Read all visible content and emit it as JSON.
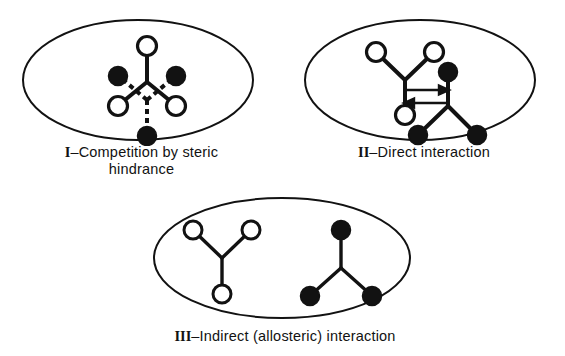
{
  "figure": {
    "background_color": "#ffffff",
    "ink_color": "#121212",
    "open_node_fill": "#ffffff",
    "filled_node_fill": "#121212",
    "width": 565,
    "height": 356
  },
  "panels": [
    {
      "id": "panel-1",
      "numeral": "I",
      "separator": "–",
      "caption_text": "Competition by steric\nhindrance",
      "caption_full": "I–Competition by steric hindrance",
      "description": "Two overlapping Y-shaped ligands sharing one binding site: a solid-line Y with open circles pointing up and a dashed-line Y with filled circles pointing down, crossing to form a diamond.",
      "shapes": {
        "ellipse": {
          "cx": 120,
          "cy": 62,
          "rx": 115,
          "ry": 60
        },
        "solid_y": {
          "style": "solid",
          "node_type": "open",
          "vertex": {
            "x": 129,
            "y": 64
          },
          "nodes": [
            {
              "x": 129,
              "y": 28,
              "label": "top-open-node"
            },
            {
              "x": 100,
              "y": 88,
              "label": "lower-left-open-node"
            },
            {
              "x": 158,
              "y": 88,
              "label": "lower-right-open-node"
            }
          ]
        },
        "dashed_y": {
          "style": "dashed",
          "node_type": "filled",
          "vertex": {
            "x": 129,
            "y": 82
          },
          "nodes": [
            {
              "x": 129,
              "y": 118,
              "label": "bottom-filled-node"
            },
            {
              "x": 100,
              "y": 58,
              "label": "upper-left-filled-node"
            },
            {
              "x": 158,
              "y": 58,
              "label": "upper-right-filled-node"
            }
          ]
        }
      }
    },
    {
      "id": "panel-2",
      "numeral": "II",
      "separator": "–",
      "caption_text": "Direct interaction",
      "caption_full": "II–Direct interaction",
      "description": "Two Y-shaped ligands at adjacent sites linked by a pair of opposed horizontal arrows indicating mutual direct influence.",
      "shapes": {
        "ellipse": {
          "cx": 120,
          "cy": 62,
          "rx": 115,
          "ry": 60
        },
        "open_y": {
          "style": "solid",
          "node_type": "open",
          "vertex": {
            "x": 105,
            "y": 62
          },
          "nodes": [
            {
              "x": 76,
              "y": 34,
              "label": "upper-left-open-node"
            },
            {
              "x": 134,
              "y": 34,
              "label": "upper-right-open-node"
            },
            {
              "x": 105,
              "y": 97,
              "label": "lower-open-node"
            }
          ]
        },
        "filled_y": {
          "style": "solid",
          "node_type": "filled",
          "vertex": {
            "x": 148,
            "y": 88
          },
          "nodes": [
            {
              "x": 148,
              "y": 54,
              "label": "top-filled-node"
            },
            {
              "x": 118,
              "y": 117,
              "label": "lower-left-filled-node"
            },
            {
              "x": 177,
              "y": 117,
              "label": "lower-right-filled-node"
            }
          ]
        },
        "arrows": [
          {
            "x1": 105,
            "y1": 72,
            "x2": 148,
            "y2": 72,
            "direction": "right",
            "label": "arrow-right"
          },
          {
            "x1": 148,
            "y1": 85,
            "x2": 105,
            "y2": 85,
            "direction": "left",
            "label": "arrow-left"
          }
        ]
      }
    },
    {
      "id": "panel-3",
      "numeral": "III",
      "separator": "–",
      "caption_text": "Indirect (allosteric) interaction",
      "caption_full": "III–Indirect (allosteric) interaction",
      "description": "Two separated Y-shaped ligands with no direct link: an inverted open-circle Y on the left and an upright filled-circle Y on the right.",
      "shapes": {
        "ellipse": {
          "cx": 132,
          "cy": 62,
          "rx": 128,
          "ry": 60
        },
        "open_y": {
          "style": "solid",
          "node_type": "open",
          "vertex": {
            "x": 72,
            "y": 62
          },
          "nodes": [
            {
              "x": 43,
              "y": 34,
              "label": "upper-left-open-node"
            },
            {
              "x": 101,
              "y": 34,
              "label": "upper-right-open-node"
            },
            {
              "x": 72,
              "y": 98,
              "label": "lower-open-node"
            }
          ]
        },
        "filled_y": {
          "style": "solid",
          "node_type": "filled",
          "vertex": {
            "x": 191,
            "y": 72
          },
          "nodes": [
            {
              "x": 191,
              "y": 34,
              "label": "top-filled-node"
            },
            {
              "x": 160,
              "y": 100,
              "label": "lower-left-filled-node"
            },
            {
              "x": 222,
              "y": 100,
              "label": "lower-right-filled-node"
            }
          ]
        }
      }
    }
  ]
}
